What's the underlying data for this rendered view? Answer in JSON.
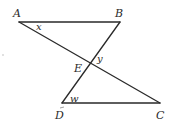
{
  "diagram": {
    "type": "geometry",
    "points": {
      "A": {
        "label": "A",
        "x": 19,
        "y": 22
      },
      "B": {
        "label": "B",
        "x": 120,
        "y": 22
      },
      "E": {
        "label": "E",
        "x": 91,
        "y": 64
      },
      "D": {
        "label": "D",
        "x": 62,
        "y": 103
      },
      "C": {
        "label": "C",
        "x": 160,
        "y": 103
      }
    },
    "segments": [
      {
        "from": "A",
        "to": "B"
      },
      {
        "from": "A",
        "to": "C"
      },
      {
        "from": "B",
        "to": "D"
      },
      {
        "from": "D",
        "to": "C"
      }
    ],
    "angle_labels": {
      "x": {
        "label": "x",
        "at": "A"
      },
      "y": {
        "label": "y",
        "at": "E"
      },
      "w": {
        "label": "w",
        "at": "D"
      }
    }
  }
}
